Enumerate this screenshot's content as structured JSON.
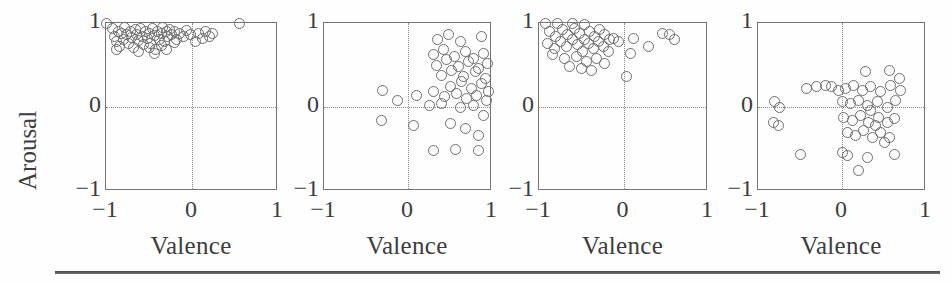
{
  "figure": {
    "y_axis_label": "Arousal",
    "x_axis_label": "Valence",
    "tick_labels": [
      "−1",
      "0",
      "1"
    ],
    "marker_style": "open-circle",
    "marker_color": "#6e6e6e",
    "axis_color": "#757575",
    "grid_color": "#8a8a8a",
    "text_color": "#3d3d3d"
  },
  "chart_data": [
    {
      "type": "scatter",
      "title": "",
      "xlabel": "Valence",
      "ylabel": "Arousal",
      "xlim": [
        -1,
        1
      ],
      "ylim": [
        -1,
        1
      ],
      "xticks": [
        -1,
        0,
        1
      ],
      "yticks": [
        -1,
        0,
        1
      ],
      "xticklabels": [
        "−1",
        "0",
        "1"
      ],
      "yticklabels": [
        "−1",
        "0",
        "1"
      ],
      "grid": "zero-crosshair-dotted",
      "legend": "none",
      "points": [
        [
          -1.0,
          1.0
        ],
        [
          -0.93,
          0.93
        ],
        [
          -0.9,
          0.84
        ],
        [
          -0.88,
          0.78
        ],
        [
          -0.86,
          0.9
        ],
        [
          -0.84,
          0.72
        ],
        [
          -0.82,
          0.88
        ],
        [
          -0.8,
          0.8
        ],
        [
          -0.78,
          0.95
        ],
        [
          -0.76,
          0.86
        ],
        [
          -0.74,
          0.76
        ],
        [
          -0.72,
          0.9
        ],
        [
          -0.7,
          0.83
        ],
        [
          -0.68,
          0.71
        ],
        [
          -0.66,
          0.92
        ],
        [
          -0.64,
          0.86
        ],
        [
          -0.62,
          0.79
        ],
        [
          -0.6,
          0.94
        ],
        [
          -0.58,
          0.84
        ],
        [
          -0.56,
          0.74
        ],
        [
          -0.54,
          0.9
        ],
        [
          -0.52,
          0.82
        ],
        [
          -0.5,
          0.88
        ],
        [
          -0.48,
          0.76
        ],
        [
          -0.46,
          0.93
        ],
        [
          -0.44,
          0.85
        ],
        [
          -0.42,
          0.68
        ],
        [
          -0.4,
          0.9
        ],
        [
          -0.38,
          0.8
        ],
        [
          -0.36,
          0.87
        ],
        [
          -0.34,
          0.95
        ],
        [
          -0.32,
          0.78
        ],
        [
          -0.3,
          0.9
        ],
        [
          -0.28,
          0.84
        ],
        [
          -0.26,
          0.92
        ],
        [
          -0.24,
          0.86
        ],
        [
          -0.2,
          0.9
        ],
        [
          -0.18,
          0.8
        ],
        [
          -0.14,
          0.88
        ],
        [
          -0.1,
          0.84
        ],
        [
          -0.06,
          0.91
        ],
        [
          -0.02,
          0.86
        ],
        [
          0.04,
          0.78
        ],
        [
          0.08,
          0.87
        ],
        [
          0.12,
          0.82
        ],
        [
          0.16,
          0.9
        ],
        [
          0.2,
          0.84
        ],
        [
          0.24,
          0.88
        ],
        [
          0.55,
          1.0
        ],
        [
          -0.62,
          0.66
        ],
        [
          -0.44,
          0.64
        ],
        [
          -0.3,
          0.69
        ],
        [
          -0.88,
          0.68
        ],
        [
          -0.5,
          0.71
        ],
        [
          -0.36,
          0.73
        ],
        [
          -0.2,
          0.77
        ]
      ]
    },
    {
      "type": "scatter",
      "title": "",
      "xlabel": "Valence",
      "ylabel": "Arousal",
      "xlim": [
        -1,
        1
      ],
      "ylim": [
        -1,
        1
      ],
      "xticks": [
        -1,
        0,
        1
      ],
      "yticks": [
        -1,
        0,
        1
      ],
      "xticklabels": [
        "−1",
        "0",
        "1"
      ],
      "yticklabels": [
        "−1",
        "0",
        "1"
      ],
      "grid": "zero-crosshair-dotted",
      "legend": "none",
      "points": [
        [
          0.35,
          0.8
        ],
        [
          0.48,
          0.86
        ],
        [
          0.62,
          0.78
        ],
        [
          0.88,
          0.84
        ],
        [
          0.3,
          0.62
        ],
        [
          0.42,
          0.68
        ],
        [
          0.55,
          0.6
        ],
        [
          0.68,
          0.66
        ],
        [
          0.78,
          0.58
        ],
        [
          0.9,
          0.64
        ],
        [
          0.34,
          0.5
        ],
        [
          0.46,
          0.56
        ],
        [
          0.6,
          0.48
        ],
        [
          0.72,
          0.54
        ],
        [
          0.84,
          0.46
        ],
        [
          0.95,
          0.52
        ],
        [
          0.4,
          0.38
        ],
        [
          0.52,
          0.44
        ],
        [
          0.66,
          0.36
        ],
        [
          0.8,
          0.42
        ],
        [
          0.92,
          0.34
        ],
        [
          0.5,
          0.24
        ],
        [
          0.64,
          0.3
        ],
        [
          0.76,
          0.22
        ],
        [
          0.88,
          0.28
        ],
        [
          0.3,
          0.18
        ],
        [
          0.44,
          0.12
        ],
        [
          0.58,
          0.16
        ],
        [
          0.7,
          0.1
        ],
        [
          0.82,
          0.14
        ],
        [
          0.94,
          0.08
        ],
        [
          -0.3,
          0.2
        ],
        [
          -0.12,
          0.08
        ],
        [
          0.1,
          0.14
        ],
        [
          0.26,
          0.02
        ],
        [
          0.4,
          0.04
        ],
        [
          0.62,
          0.0
        ],
        [
          0.78,
          0.02
        ],
        [
          -0.32,
          -0.16
        ],
        [
          0.06,
          -0.22
        ],
        [
          0.5,
          -0.2
        ],
        [
          0.68,
          -0.26
        ],
        [
          0.84,
          -0.34
        ],
        [
          0.3,
          -0.52
        ],
        [
          0.56,
          -0.5
        ],
        [
          0.84,
          -0.52
        ],
        [
          0.96,
          0.18
        ],
        [
          0.9,
          -0.1
        ]
      ]
    },
    {
      "type": "scatter",
      "title": "",
      "xlabel": "Valence",
      "ylabel": "Arousal",
      "xlim": [
        -1,
        1
      ],
      "ylim": [
        -1,
        1
      ],
      "xticks": [
        -1,
        0,
        1
      ],
      "yticks": [
        -1,
        0,
        1
      ],
      "xticklabels": [
        "−1",
        "0",
        "1"
      ],
      "yticklabels": [
        "−1",
        "0",
        "1"
      ],
      "grid": "zero-crosshair-dotted",
      "legend": "none",
      "points": [
        [
          -0.92,
          1.0
        ],
        [
          -0.78,
          1.0
        ],
        [
          -0.6,
          1.0
        ],
        [
          -0.46,
          0.98
        ],
        [
          -0.88,
          0.9
        ],
        [
          -0.8,
          0.84
        ],
        [
          -0.72,
          0.92
        ],
        [
          -0.66,
          0.86
        ],
        [
          -0.58,
          0.94
        ],
        [
          -0.52,
          0.88
        ],
        [
          -0.46,
          0.8
        ],
        [
          -0.4,
          0.9
        ],
        [
          -0.34,
          0.84
        ],
        [
          -0.28,
          0.92
        ],
        [
          -0.22,
          0.86
        ],
        [
          -0.16,
          0.8
        ],
        [
          -0.9,
          0.76
        ],
        [
          -0.82,
          0.7
        ],
        [
          -0.74,
          0.78
        ],
        [
          -0.68,
          0.72
        ],
        [
          -0.6,
          0.8
        ],
        [
          -0.54,
          0.74
        ],
        [
          -0.48,
          0.66
        ],
        [
          -0.42,
          0.76
        ],
        [
          -0.36,
          0.7
        ],
        [
          -0.3,
          0.78
        ],
        [
          -0.24,
          0.72
        ],
        [
          -0.18,
          0.66
        ],
        [
          -0.84,
          0.62
        ],
        [
          -0.7,
          0.58
        ],
        [
          -0.56,
          0.6
        ],
        [
          -0.44,
          0.54
        ],
        [
          -0.32,
          0.58
        ],
        [
          -0.22,
          0.52
        ],
        [
          -0.12,
          0.82
        ],
        [
          -0.06,
          0.78
        ],
        [
          0.08,
          0.64
        ],
        [
          0.12,
          0.82
        ],
        [
          0.3,
          0.72
        ],
        [
          0.46,
          0.88
        ],
        [
          0.54,
          0.86
        ],
        [
          0.6,
          0.8
        ],
        [
          0.04,
          0.36
        ],
        [
          -0.5,
          0.46
        ],
        [
          -0.64,
          0.48
        ],
        [
          -0.38,
          0.44
        ]
      ]
    },
    {
      "type": "scatter",
      "title": "",
      "xlabel": "Valence",
      "ylabel": "Arousal",
      "xlim": [
        -1,
        1
      ],
      "ylim": [
        -1,
        1
      ],
      "xticks": [
        -1,
        0,
        1
      ],
      "yticks": [
        -1,
        0,
        1
      ],
      "xticklabels": [
        "−1",
        "0",
        "1"
      ],
      "yticklabels": [
        "−1",
        "0",
        "1"
      ],
      "grid": "zero-crosshair-dotted",
      "legend": "none",
      "points": [
        [
          0.28,
          0.42
        ],
        [
          0.56,
          0.44
        ],
        [
          0.68,
          0.34
        ],
        [
          -0.42,
          0.22
        ],
        [
          -0.3,
          0.24
        ],
        [
          -0.2,
          0.26
        ],
        [
          -0.12,
          0.24
        ],
        [
          -0.04,
          0.2
        ],
        [
          0.04,
          0.22
        ],
        [
          0.14,
          0.26
        ],
        [
          0.24,
          0.2
        ],
        [
          0.34,
          0.24
        ],
        [
          0.46,
          0.18
        ],
        [
          0.58,
          0.26
        ],
        [
          0.7,
          0.2
        ],
        [
          -0.8,
          0.06
        ],
        [
          -0.74,
          0.0
        ],
        [
          0.0,
          0.06
        ],
        [
          0.1,
          0.04
        ],
        [
          0.2,
          0.08
        ],
        [
          0.3,
          0.02
        ],
        [
          0.42,
          0.06
        ],
        [
          0.54,
          0.0
        ],
        [
          0.64,
          0.08
        ],
        [
          -0.82,
          -0.18
        ],
        [
          -0.76,
          -0.22
        ],
        [
          0.02,
          -0.12
        ],
        [
          0.12,
          -0.16
        ],
        [
          0.22,
          -0.1
        ],
        [
          0.32,
          -0.18
        ],
        [
          0.44,
          -0.12
        ],
        [
          0.54,
          -0.18
        ],
        [
          0.62,
          -0.14
        ],
        [
          0.06,
          -0.3
        ],
        [
          0.16,
          -0.34
        ],
        [
          0.26,
          -0.28
        ],
        [
          0.36,
          -0.36
        ],
        [
          0.46,
          -0.3
        ],
        [
          0.56,
          -0.36
        ],
        [
          -0.5,
          -0.56
        ],
        [
          0.0,
          -0.54
        ],
        [
          0.06,
          -0.58
        ],
        [
          0.3,
          -0.6
        ],
        [
          0.62,
          -0.56
        ],
        [
          0.2,
          -0.76
        ],
        [
          0.4,
          -0.22
        ],
        [
          0.34,
          -0.04
        ],
        [
          0.5,
          -0.42
        ]
      ]
    }
  ]
}
